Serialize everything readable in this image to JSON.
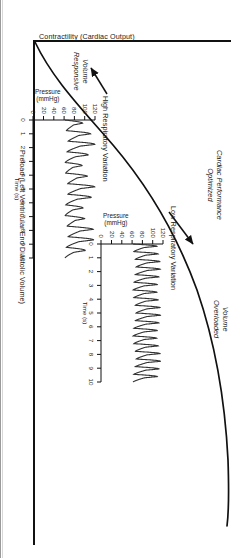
{
  "figure": {
    "type": "frank-starling-curve",
    "orientation_deg": 90,
    "axes": {
      "y_label": "Contractility (Cardiac Output)",
      "x_label": "Preload (Left Ventricular End Diastolic Volume)"
    },
    "callouts": [
      {
        "id": "volume-responsive",
        "line1": "Volume",
        "line2": "Responsive"
      },
      {
        "id": "cardiac-performance-optimized",
        "line1": "Cardiac Performance",
        "line2": "Optimized"
      },
      {
        "id": "volume-overloaded",
        "line1": "Volume",
        "line2": "Overloaded"
      }
    ],
    "annotations": [
      {
        "id": "high-respiratory-variation",
        "label": "High Respiratory Variation"
      },
      {
        "id": "low-respiratory-variation",
        "label": "Low Respiratory Variation"
      }
    ]
  },
  "insets": {
    "high": {
      "title": "High Respiratory Variation",
      "y_label_line1": "Pressure",
      "y_label_line2": "(mmHg)",
      "x_label": "Time (s)",
      "y_ticks": [
        "120",
        "100",
        "80",
        "60",
        "40",
        "20",
        "0"
      ],
      "x_ticks": [
        "0",
        "1",
        "2",
        "3",
        "4",
        "5",
        "6",
        "7",
        "8",
        "9",
        "10"
      ]
    },
    "low": {
      "title": "Low Respiratory Variation",
      "y_label_line1": "Pressure",
      "y_label_line2": "(mmHg)",
      "x_label": "Time (s)",
      "y_ticks": [
        "120",
        "100",
        "80",
        "60",
        "40",
        "20",
        "0"
      ],
      "x_ticks": [
        "0",
        "1",
        "2",
        "3",
        "4",
        "5",
        "6",
        "7",
        "8",
        "9",
        "10"
      ]
    }
  },
  "chart_data": {
    "type": "line",
    "title": "",
    "xlabel": "Preload (Left Ventricular End Diastolic Volume)",
    "ylabel": "Contractility (Cardiac Output)",
    "xlim": [
      0,
      10
    ],
    "ylim": [
      0,
      100
    ],
    "grid": false,
    "legend": "none",
    "series": [
      {
        "name": "Frank-Starling curve",
        "x": [
          0.0,
          0.5,
          1.0,
          1.5,
          2.0,
          2.5,
          3.0,
          3.5,
          4.0,
          4.5,
          5.0,
          5.5,
          6.0,
          6.5,
          7.0,
          7.5,
          8.0,
          8.5,
          9.0,
          9.5,
          10.0
        ],
        "y": [
          0,
          13,
          25,
          35,
          44,
          52,
          59,
          65,
          70,
          75,
          79,
          83,
          86,
          88.5,
          90.5,
          92,
          93,
          94,
          94.6,
          95,
          95.2
        ]
      }
    ],
    "annotations": [
      {
        "text": "Volume Responsive",
        "x": 1.6,
        "y": 37,
        "style": "italic"
      },
      {
        "text": "Cardiac Performance Optimized",
        "x": 5.0,
        "y": 92,
        "style": "italic"
      },
      {
        "text": "Volume Overloaded",
        "x": 8.3,
        "y": 97,
        "style": "italic"
      },
      {
        "text": "High Respiratory Variation",
        "x": 2.3,
        "y": 45,
        "pointer": true
      },
      {
        "text": "Low Respiratory Variation",
        "x": 6.4,
        "y": 86,
        "pointer": true
      }
    ],
    "insets": [
      {
        "name": "High Respiratory Variation",
        "type": "line",
        "xlabel": "Time (s)",
        "ylabel": "Pressure (mmHg)",
        "xlim": [
          0,
          10
        ],
        "ylim": [
          0,
          120
        ],
        "xticks": [
          0,
          1,
          2,
          3,
          4,
          5,
          6,
          7,
          8,
          9,
          10
        ],
        "yticks": [
          0,
          20,
          40,
          60,
          80,
          100,
          120
        ],
        "description": "Arterial pressure waveform, systolic ~95-120 mmHg, diastolic ~60-75 mmHg, with large respiratory swing in systolic peak amplitude (pulse pressure variation high)",
        "beat_rate_per_10s": 13,
        "respiratory_cycles_per_10s": 3,
        "systolic_envelope_max": 120,
        "systolic_envelope_min": 95,
        "diastolic_mean": 65
      },
      {
        "name": "Low Respiratory Variation",
        "type": "line",
        "xlabel": "Time (s)",
        "ylabel": "Pressure (mmHg)",
        "xlim": [
          0,
          10
        ],
        "ylim": [
          0,
          120
        ],
        "xticks": [
          0,
          1,
          2,
          3,
          4,
          5,
          6,
          7,
          8,
          9,
          10
        ],
        "yticks": [
          0,
          20,
          40,
          60,
          80,
          100,
          120
        ],
        "description": "Arterial pressure waveform, systolic ~108-115 mmHg, diastolic ~62-68 mmHg, minimal respiratory swing (pulse pressure variation low)",
        "beat_rate_per_10s": 18,
        "respiratory_cycles_per_10s": 3,
        "systolic_envelope_max": 115,
        "systolic_envelope_min": 108,
        "diastolic_mean": 65
      }
    ]
  }
}
